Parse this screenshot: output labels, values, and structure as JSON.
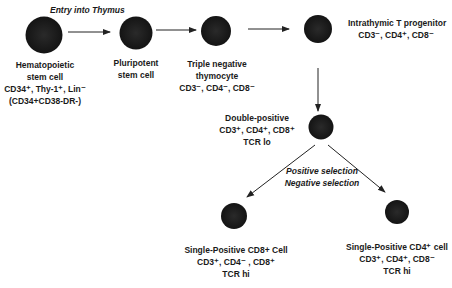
{
  "annotations": {
    "entry": "Entry into Thymus",
    "selection_1": "Positive selection",
    "selection_2": "Negative selection"
  },
  "nodes": [
    {
      "id": "hsc",
      "lines": [
        "Hematopoietic",
        "stem cell",
        "CD34⁺, Thy-1⁺, Lin⁻",
        "(CD34+CD38-DR-)"
      ]
    },
    {
      "id": "pluripotent",
      "lines": [
        "Pluripotent",
        "stem cell"
      ]
    },
    {
      "id": "triple_negative",
      "lines": [
        "Triple negative",
        "thymocyte",
        "CD3⁻, CD4⁻, CD8⁻"
      ]
    },
    {
      "id": "intrathymic",
      "lines": [
        "Intrathymic T progenitor",
        "CD3⁻, CD4⁺, CD8⁻"
      ]
    },
    {
      "id": "double_positive",
      "lines": [
        "Double-positive",
        "CD3⁺, CD4⁺, CD8⁺",
        "TCR lo"
      ]
    },
    {
      "id": "sp_cd8",
      "lines": [
        "Single-Positive CD8+ Cell",
        "CD3⁺, CD4⁻ , CD8⁺",
        "TCR hi"
      ]
    },
    {
      "id": "sp_cd4",
      "lines": [
        "Single-Positive CD4⁺ cell",
        "CD3⁺, CD4⁺, CD8⁻",
        "TCR hi"
      ]
    }
  ],
  "colors": {
    "cell": "#1c1c1c",
    "arrow": "#222222",
    "text": "#1a1a1a"
  }
}
